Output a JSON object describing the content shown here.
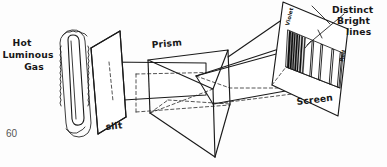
{
  "figure": {
    "page_number": "60",
    "ink_color": "#1a1a1a",
    "background_color": "#fdfdfd"
  },
  "labels": {
    "source": "Hot\nLuminous\nGas",
    "source_line1": "Hot",
    "source_line2": "Luminous",
    "source_line3": "Gas",
    "slit": "slit",
    "prism": "Prism",
    "screen": "Screen",
    "violet": "Violet",
    "red": "Red",
    "callout_line1": "Distinct",
    "callout_line2": "Bright",
    "callout_line3": "lines"
  },
  "components": [
    {
      "name": "hot-luminous-gas-tube",
      "label": "Hot Luminous Gas"
    },
    {
      "name": "slit-panel",
      "label": "slit"
    },
    {
      "name": "prism",
      "label": "Prism"
    },
    {
      "name": "screen-panel",
      "label": "Screen"
    }
  ],
  "chart_data": {
    "type": "line",
    "xlabel": "Wavelength",
    "ylabel": "",
    "grid": false,
    "legend": "none",
    "categories": [
      "Violet",
      "Red"
    ],
    "annotations": [
      "Distinct Bright lines"
    ],
    "spectral_lines": [
      {
        "position": 0.02,
        "width": 0.035,
        "intensity": 1.0
      },
      {
        "position": 0.07,
        "width": 0.03,
        "intensity": 1.0
      },
      {
        "position": 0.115,
        "width": 0.022,
        "intensity": 0.95
      },
      {
        "position": 0.155,
        "width": 0.028,
        "intensity": 1.0
      },
      {
        "position": 0.2,
        "width": 0.02,
        "intensity": 0.9
      },
      {
        "position": 0.245,
        "width": 0.026,
        "intensity": 1.0
      },
      {
        "position": 0.3,
        "width": 0.018,
        "intensity": 0.85
      },
      {
        "position": 0.44,
        "width": 0.028,
        "intensity": 0.9
      },
      {
        "position": 0.6,
        "width": 0.03,
        "intensity": 0.9
      },
      {
        "position": 0.8,
        "width": 0.032,
        "intensity": 0.9
      },
      {
        "position": 0.95,
        "width": 0.03,
        "intensity": 0.9
      }
    ]
  }
}
